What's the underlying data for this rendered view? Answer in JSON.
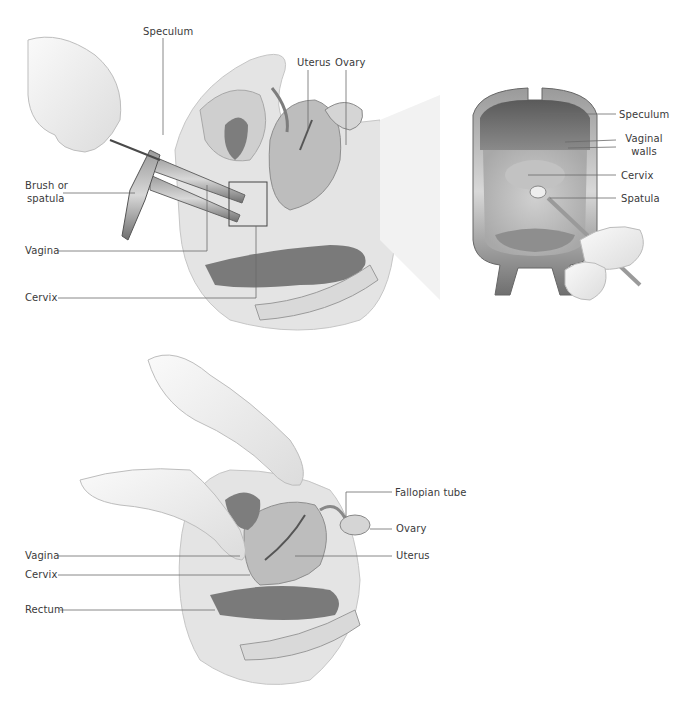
{
  "figure": {
    "panels": [
      {
        "id": "speculum-exam-sagittal",
        "labels": {
          "speculum": "Speculum",
          "uterus": "Uterus",
          "ovary": "Ovary",
          "brush_or_spatula_line1": "Brush or",
          "brush_or_spatula_line2": "spatula",
          "vagina": "Vagina",
          "cervix": "Cervix"
        }
      },
      {
        "id": "speculum-view",
        "labels": {
          "speculum": "Speculum",
          "vaginal_walls_line1": "Vaginal",
          "vaginal_walls_line2": "walls",
          "cervix": "Cervix",
          "spatula": "Spatula"
        }
      },
      {
        "id": "bimanual-exam-sagittal",
        "labels": {
          "fallopian_tube": "Fallopian tube",
          "ovary": "Ovary",
          "vagina": "Vagina",
          "uterus": "Uterus",
          "cervix": "Cervix",
          "rectum": "Rectum"
        }
      }
    ],
    "colors": {
      "background": "#ffffff",
      "label_text": "#3a3a3a",
      "leader_line": "#6a6a6a",
      "tissue_light": "#e6e6e6",
      "tissue_mid": "#bdbdbd",
      "tissue_dark": "#7c7c7c",
      "glove": "#f1f1f1"
    }
  }
}
